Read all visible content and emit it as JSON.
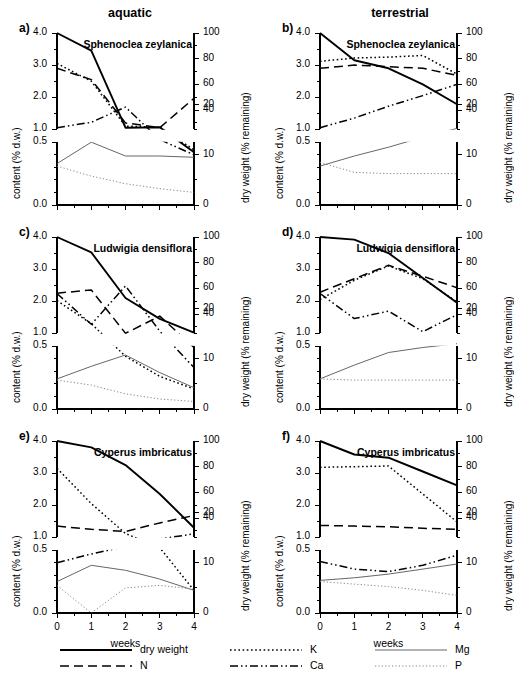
{
  "figure": {
    "column_titles": {
      "left": "aquatic",
      "right": "terrestrial"
    },
    "xlabel": "weeks",
    "ylabel_left": "content (% d.w.)",
    "ylabel_right": "dry weight (% remaining)",
    "x_ticks": [
      "0",
      "1",
      "2",
      "3",
      "4"
    ],
    "y_ticks_left_upper": [
      "4.0",
      "3.0",
      "2.0",
      "1.0"
    ],
    "y_ticks_left_lower": [
      "0.5",
      "0.0"
    ],
    "y_ticks_right_upper": [
      "100",
      "80",
      "60",
      "40"
    ],
    "y_ticks_right_lower": [
      "20",
      "10",
      "0"
    ]
  },
  "legend": {
    "entries": [
      {
        "label": "dry weight",
        "style": "solid-thick",
        "color": "#000000"
      },
      {
        "label": "N",
        "style": "dashed",
        "color": "#000000"
      },
      {
        "label": "K",
        "style": "dotted-bold",
        "color": "#000000"
      },
      {
        "label": "Ca",
        "style": "dash-dot-dot",
        "color": "#000000"
      },
      {
        "label": "Mg",
        "style": "solid-thin",
        "color": "#555555"
      },
      {
        "label": "P",
        "style": "dotted-thin",
        "color": "#777777"
      }
    ]
  },
  "chart_data": {
    "type": "line",
    "xlabel": "weeks",
    "ylabel": "content (% d.w.)",
    "ylabel_secondary": "dry weight (% remaining)",
    "x": [
      0,
      1,
      2,
      3,
      4
    ],
    "xlim": [
      0,
      4
    ],
    "ylim_left_upper": [
      1.0,
      4.0
    ],
    "ylim_left_lower": [
      0.0,
      0.5
    ],
    "ylim_right_upper": [
      25,
      100
    ],
    "ylim_right_lower": [
      0,
      25
    ],
    "axis_break": true,
    "grid": false,
    "legend_position": "bottom",
    "panels": [
      {
        "id": "a",
        "letter": "a)",
        "species": "Sphenoclea zeylanica",
        "environment": "aquatic",
        "series": [
          {
            "name": "dry weight",
            "style": "solid-thick",
            "values": [
              4.0,
              3.45,
              1.05,
              0.62,
              0.42
            ]
          },
          {
            "name": "N",
            "style": "dashed",
            "values": [
              2.9,
              2.55,
              1.2,
              1.05,
              0.85
            ]
          },
          {
            "name": "K",
            "style": "dotted-bold",
            "values": [
              3.05,
              2.5,
              1.1,
              0.62,
              0.44
            ]
          },
          {
            "name": "Ca",
            "style": "dash-dot-dot",
            "values": [
              1.05,
              1.22,
              0.78,
              0.52,
              0.4
            ]
          },
          {
            "name": "Mg",
            "style": "solid-thin",
            "values": [
              0.33,
              0.5,
              0.39,
              0.39,
              0.38
            ]
          },
          {
            "name": "P",
            "style": "dotted-thin",
            "values": [
              0.31,
              0.23,
              0.17,
              0.13,
              0.1
            ]
          }
        ]
      },
      {
        "id": "b",
        "letter": "b)",
        "species": "Sphenoclea zeylanica",
        "environment": "terrestrial",
        "series": [
          {
            "name": "dry weight",
            "style": "solid-thick",
            "values": [
              4.0,
              3.15,
              2.9,
              2.4,
              1.78
            ]
          },
          {
            "name": "N",
            "style": "dashed",
            "values": [
              2.9,
              3.0,
              2.95,
              2.9,
              2.68
            ]
          },
          {
            "name": "K",
            "style": "dotted-bold",
            "values": [
              3.12,
              3.22,
              3.25,
              3.3,
              2.72
            ]
          },
          {
            "name": "Ca",
            "style": "dash-dot-dot",
            "values": [
              1.05,
              1.35,
              1.72,
              2.05,
              2.4
            ]
          },
          {
            "name": "Mg",
            "style": "solid-thin",
            "values": [
              0.31,
              0.39,
              0.46,
              0.54,
              0.61
            ]
          },
          {
            "name": "P",
            "style": "dotted-thin",
            "values": [
              0.34,
              0.26,
              0.25,
              0.25,
              0.25
            ]
          }
        ]
      },
      {
        "id": "c",
        "letter": "c)",
        "species": "Ludwigia densiflora",
        "environment": "aquatic",
        "series": [
          {
            "name": "dry weight",
            "style": "solid-thick",
            "values": [
              4.0,
              3.52,
              2.1,
              1.45,
              1.02
            ]
          },
          {
            "name": "N",
            "style": "dashed",
            "values": [
              2.25,
              2.35,
              1.0,
              0.74,
              0.49
            ]
          },
          {
            "name": "K",
            "style": "dotted-bold",
            "values": [
              2.02,
              1.3,
              0.42,
              0.26,
              0.16
            ]
          },
          {
            "name": "Ca",
            "style": "dash-dot-dot",
            "values": [
              0.92,
              1.28,
              0.98,
              0.62,
              0.33
            ]
          },
          {
            "name": "Mg",
            "style": "solid-thin",
            "values": [
              0.24,
              0.34,
              0.43,
              0.29,
              0.17
            ]
          },
          {
            "name": "P",
            "style": "dotted-thin",
            "values": [
              0.23,
              0.19,
              0.12,
              0.08,
              0.06
            ]
          }
        ]
      },
      {
        "id": "d",
        "letter": "d)",
        "species": "Ludwigia densiflora",
        "environment": "terrestrial",
        "series": [
          {
            "name": "dry weight",
            "style": "solid-thick",
            "values": [
              4.0,
              3.92,
              3.5,
              2.72,
              1.95
            ]
          },
          {
            "name": "N",
            "style": "dashed",
            "values": [
              2.28,
              2.7,
              3.12,
              2.78,
              2.42
            ]
          },
          {
            "name": "K",
            "style": "dotted-bold",
            "values": [
              2.05,
              2.65,
              3.1,
              2.7,
              1.98
            ]
          },
          {
            "name": "Ca",
            "style": "dash-dot-dot",
            "values": [
              0.92,
              0.72,
              0.78,
              1.05,
              1.58
            ]
          },
          {
            "name": "Mg",
            "style": "solid-thin",
            "values": [
              0.24,
              0.35,
              0.45,
              0.49,
              0.52
            ]
          },
          {
            "name": "P",
            "style": "dotted-thin",
            "values": [
              0.24,
              0.23,
              0.23,
              0.23,
              0.23
            ]
          }
        ]
      },
      {
        "id": "e",
        "letter": "e)",
        "species": "Cyperus imbricatus",
        "environment": "aquatic",
        "series": [
          {
            "name": "dry weight",
            "style": "solid-thick",
            "values": [
              4.0,
              3.8,
              3.25,
              2.35,
              1.3
            ]
          },
          {
            "name": "N",
            "style": "dashed",
            "values": [
              1.35,
              1.25,
              1.18,
              1.45,
              1.68
            ]
          },
          {
            "name": "K",
            "style": "dotted-bold",
            "values": [
              3.15,
              2.05,
              1.12,
              0.52,
              0.18
            ]
          },
          {
            "name": "Ca",
            "style": "dash-dot-dot",
            "values": [
              0.4,
              0.47,
              0.53,
              0.59,
              0.63
            ]
          },
          {
            "name": "Mg",
            "style": "solid-thin",
            "values": [
              0.25,
              0.38,
              0.34,
              0.27,
              0.18
            ]
          },
          {
            "name": "P",
            "style": "dotted-thin",
            "values": [
              0.22,
              0.0,
              0.2,
              0.22,
              0.19
            ]
          }
        ]
      },
      {
        "id": "f",
        "letter": "f)",
        "species": "Cyperus imbricatus",
        "environment": "terrestrial",
        "series": [
          {
            "name": "dry weight",
            "style": "solid-thick",
            "values": [
              4.0,
              3.58,
              3.48,
              3.05,
              2.62
            ]
          },
          {
            "name": "N",
            "style": "dashed",
            "values": [
              1.37,
              1.35,
              1.33,
              1.28,
              1.25
            ]
          },
          {
            "name": "K",
            "style": "dotted-bold",
            "values": [
              3.18,
              3.2,
              3.22,
              2.35,
              1.48
            ]
          },
          {
            "name": "Ca",
            "style": "dash-dot-dot",
            "values": [
              0.41,
              0.35,
              0.33,
              0.38,
              0.46
            ]
          },
          {
            "name": "Mg",
            "style": "solid-thin",
            "values": [
              0.26,
              0.28,
              0.31,
              0.35,
              0.39
            ]
          },
          {
            "name": "P",
            "style": "dotted-thin",
            "values": [
              0.25,
              0.23,
              0.21,
              0.18,
              0.14
            ]
          }
        ]
      }
    ]
  }
}
